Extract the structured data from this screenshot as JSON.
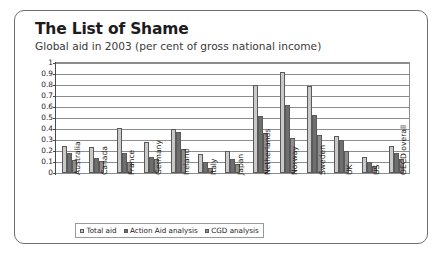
{
  "card": {
    "title": "The List of Shame",
    "subtitle": "Global aid in 2003 (per cent of gross national income)"
  },
  "chart_data": {
    "type": "bar",
    "title": "The List of Shame",
    "subtitle": "Global aid in 2003 (per cent of gross national income)",
    "xlabel": "",
    "ylabel": "",
    "ylim": [
      0,
      1
    ],
    "yticks": [
      "0",
      "0.1",
      "0.2",
      "0.3",
      "0.4",
      "0.5",
      "0.6",
      "0.7",
      "0.8",
      "0.9",
      "1"
    ],
    "grid": true,
    "legend_position": "bottom",
    "categories": [
      "Australia",
      "Canada",
      "France",
      "Germany",
      "Ireland",
      "Italy",
      "Japan",
      "Netherlands",
      "Norway",
      "Sweden",
      "UK",
      "US",
      "OECD overall"
    ],
    "series": [
      {
        "name": "Total aid",
        "color": "#c9c9c9",
        "values": [
          0.25,
          0.24,
          0.41,
          0.28,
          0.4,
          0.17,
          0.2,
          0.8,
          0.92,
          0.79,
          0.34,
          0.15,
          0.25
        ]
      },
      {
        "name": "Action Aid analysis",
        "color": "#6e6e6e",
        "values": [
          0.18,
          0.14,
          0.18,
          0.15,
          0.37,
          0.1,
          0.13,
          0.52,
          0.62,
          0.53,
          0.3,
          0.1,
          0.18
        ]
      },
      {
        "name": "CGD analysis",
        "color": "#8f8f8f",
        "values": [
          0.12,
          0.11,
          0.1,
          0.13,
          0.22,
          0.05,
          0.08,
          0.36,
          0.32,
          0.35,
          0.2,
          0.06,
          0.13
        ]
      }
    ]
  }
}
